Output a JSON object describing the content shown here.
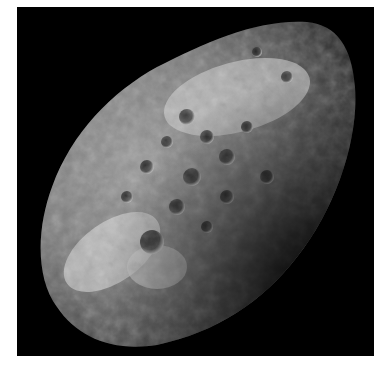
{
  "image": {
    "subject": "heavily cratered irregular moon",
    "background_color": "#000000",
    "border_color": "#ffffff",
    "palette": [
      "#000000",
      "#2a2a2a",
      "#5a5a5a",
      "#8c8c8c",
      "#cfcfcf",
      "#f0f0f0"
    ]
  }
}
